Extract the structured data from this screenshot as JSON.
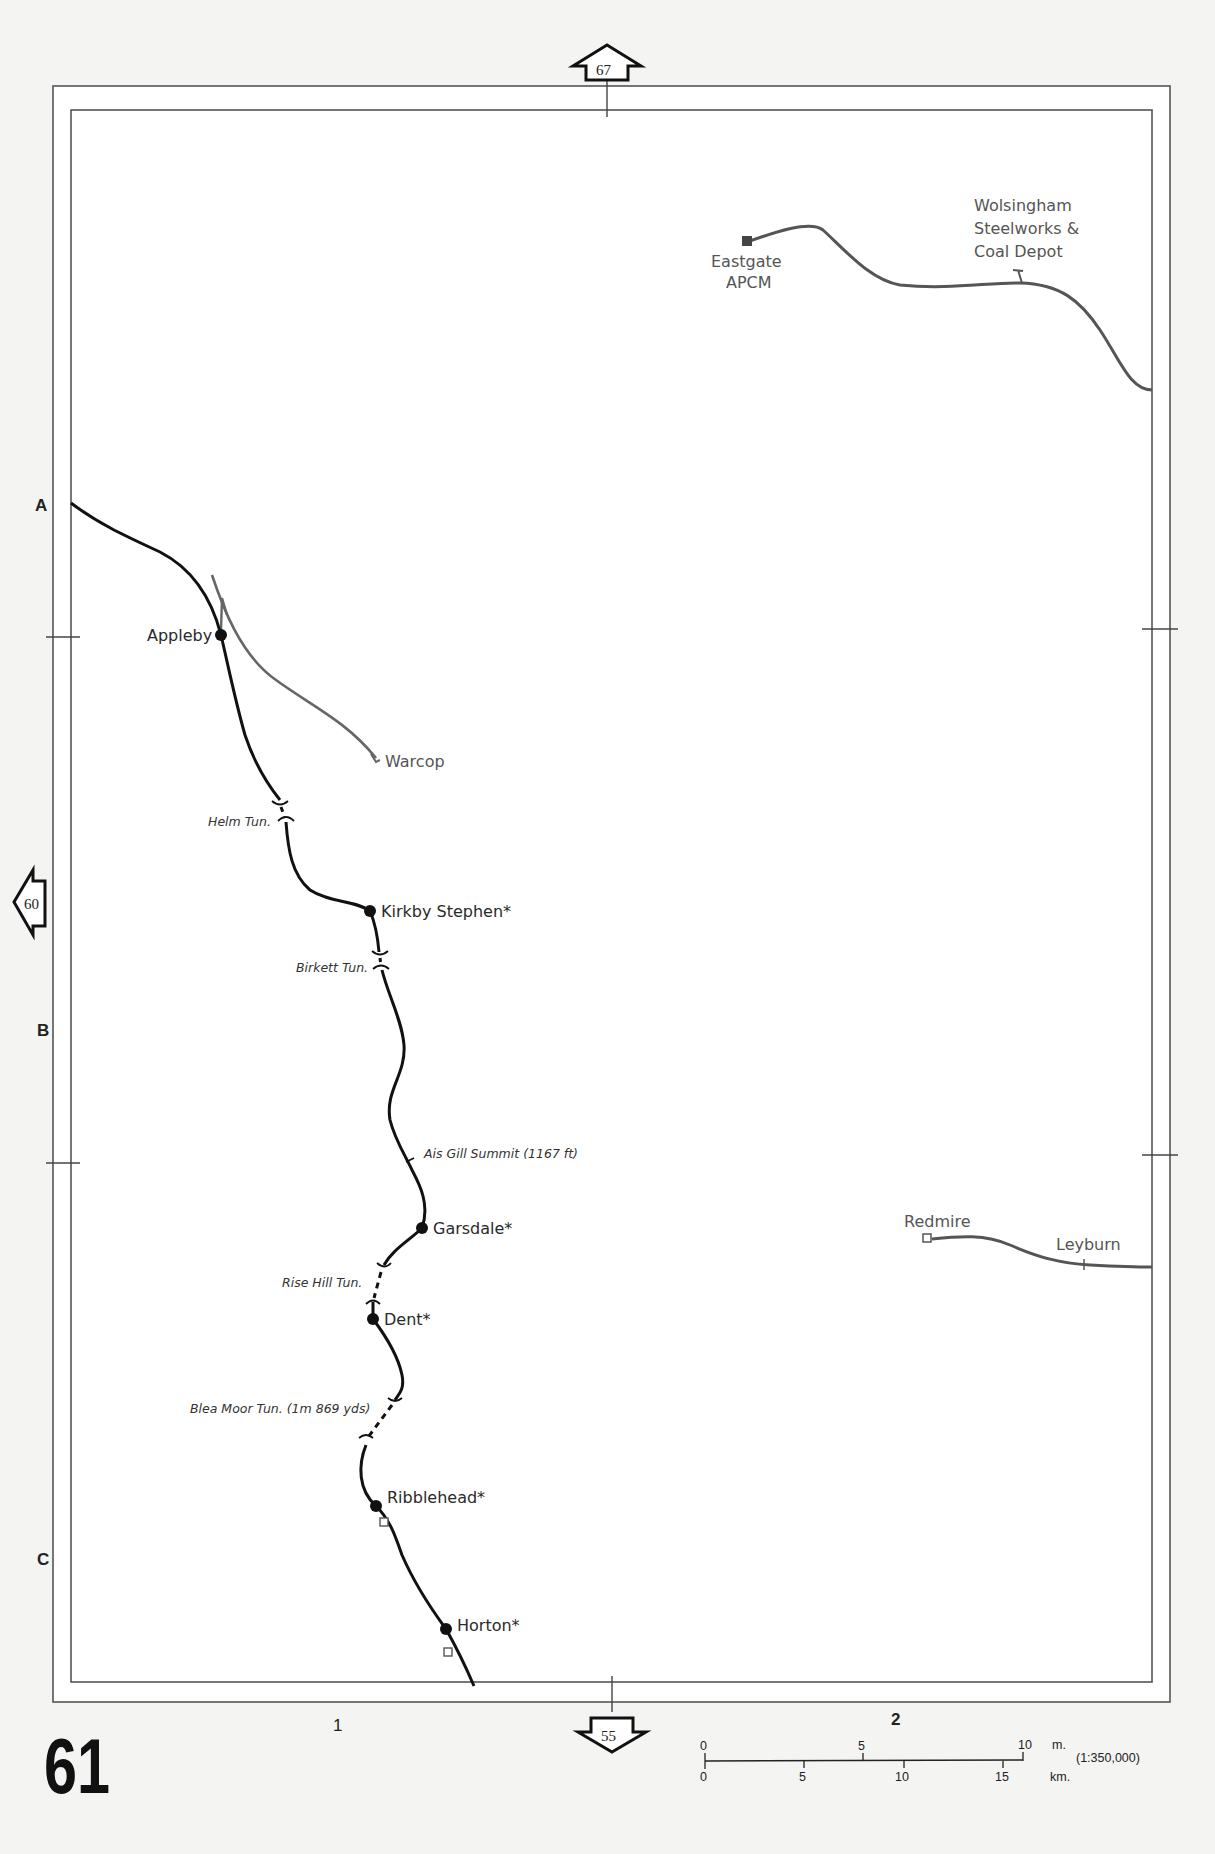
{
  "page": {
    "number": "61",
    "scale_ratio": "(1:350,000)"
  },
  "page_refs": {
    "north": "67",
    "south": "55",
    "west": "60"
  },
  "grid": {
    "rows": [
      "A",
      "B",
      "C"
    ],
    "cols": [
      "1",
      "2"
    ]
  },
  "main_line": {
    "stations": [
      {
        "name": "Appleby",
        "type": "station"
      },
      {
        "name": "Kirkby Stephen*",
        "type": "station"
      },
      {
        "name": "Garsdale*",
        "type": "station"
      },
      {
        "name": "Dent*",
        "type": "station"
      },
      {
        "name": "Ribblehead*",
        "type": "station"
      },
      {
        "name": "Horton*",
        "type": "station"
      }
    ],
    "features": [
      {
        "name": "Helm Tun.",
        "type": "tunnel"
      },
      {
        "name": "Birkett Tun.",
        "type": "tunnel"
      },
      {
        "name": "Ais Gill Summit (1167 ft)",
        "type": "summit"
      },
      {
        "name": "Rise Hill Tun.",
        "type": "tunnel"
      },
      {
        "name": "Blea Moor Tun. (1m 869 yds)",
        "type": "tunnel"
      }
    ]
  },
  "branch_lines": {
    "warcop": {
      "terminus": "Warcop"
    },
    "weardale": {
      "terminus": "Eastgate",
      "terminus_line2": "APCM",
      "siding_line1": "Wolsingham",
      "siding_line2": "Steelworks &",
      "siding_line3": "Coal Depot"
    },
    "wensleydale": {
      "terminus": "Redmire",
      "station": "Leyburn"
    }
  },
  "scale_bar": {
    "miles_ticks": [
      "0",
      "5",
      "10"
    ],
    "miles_unit": "m.",
    "km_ticks": [
      "0",
      "5",
      "10",
      "15"
    ],
    "km_unit": "km."
  },
  "colors": {
    "main_line": "#111111",
    "branch_line": "#666666",
    "frame": "#555555",
    "background": "#ffffff"
  }
}
